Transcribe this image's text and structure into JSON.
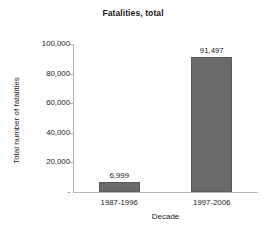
{
  "chart_data": {
    "type": "bar",
    "title": "Fatalities, total",
    "xlabel": "Decade",
    "ylabel": "Total number of fatalities",
    "categories": [
      "1987-1996",
      "1997-2006"
    ],
    "values": [
      6999,
      91497
    ],
    "value_labels": [
      "6,999",
      "91,497"
    ],
    "ylim": [
      0,
      100000
    ],
    "ytick_values": [
      100000,
      80000,
      60000,
      40000,
      20000,
      0
    ],
    "ytick_labels": [
      "100,000",
      "80,000",
      "60,000",
      "40,000",
      "20,000",
      "-"
    ],
    "grid": false,
    "legend": "none",
    "series": [
      {
        "name": "Fatalities, total",
        "values": [
          6999,
          91497
        ],
        "color": "#6b6b6b"
      }
    ],
    "bar_color": "#6b6b6b",
    "bar_border_color": "#5a5a5a",
    "axis_color": "#b5b5b5",
    "text_color": "#1a1a1a",
    "background": "#ffffff"
  }
}
